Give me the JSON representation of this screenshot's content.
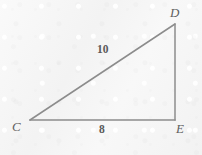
{
  "figure": {
    "kind": "right-triangle-diagram",
    "stroke_color": "#8c8c8c",
    "label_color": "#5f5f5f",
    "background_color": "#f6f6f6",
    "canvas": {
      "width": 202,
      "height": 155
    },
    "vertices": [
      {
        "id": "C",
        "label": "C",
        "x": 30,
        "y": 120,
        "label_x": 12,
        "label_y": 120
      },
      {
        "id": "D",
        "label": "D",
        "x": 175,
        "y": 24,
        "label_x": 170,
        "label_y": 6
      },
      {
        "id": "E",
        "label": "E",
        "x": 175,
        "y": 120,
        "label_x": 176,
        "label_y": 122
      }
    ],
    "sides": [
      {
        "id": "CD",
        "from": "C",
        "to": "D",
        "label": "10",
        "role": "hypotenuse"
      },
      {
        "id": "CE",
        "from": "C",
        "to": "E",
        "label": "8",
        "role": "base"
      },
      {
        "id": "DE",
        "from": "D",
        "to": "E",
        "label": "",
        "role": "vertical-leg"
      }
    ],
    "right_angle_at": "E"
  }
}
